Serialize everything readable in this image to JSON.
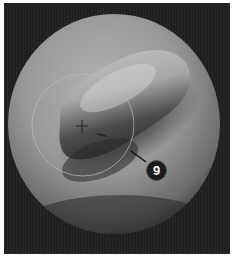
{
  "viewport": {
    "background_color": "#1e1e1e",
    "object": "sphere",
    "sphere_color": "#9a9a9a",
    "brush": {
      "shape": "circle",
      "center": [
        83,
        125
      ],
      "radius": 51,
      "cursor": "crosshair"
    }
  },
  "callout": {
    "number": "9",
    "color": "#1a1a1a",
    "text_color": "#ffffff"
  }
}
